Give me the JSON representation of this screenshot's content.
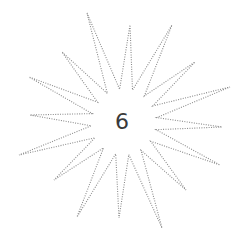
{
  "puzzle": {
    "center_label": "6",
    "line_color": "#8a8a8a",
    "text_color": "#3a3a3a",
    "center": [
      124,
      122
    ],
    "outer_tips": [
      [
        87,
        13
      ],
      [
        130,
        25
      ],
      [
        172,
        25
      ],
      [
        195,
        62
      ],
      [
        230,
        87
      ],
      [
        222,
        127
      ],
      [
        220,
        165
      ],
      [
        186,
        190
      ],
      [
        162,
        228
      ],
      [
        119,
        218
      ],
      [
        77,
        217
      ],
      [
        54,
        180
      ],
      [
        19,
        155
      ],
      [
        30,
        115
      ],
      [
        29,
        77
      ],
      [
        62,
        52
      ]
    ],
    "inner_radius": 33
  }
}
